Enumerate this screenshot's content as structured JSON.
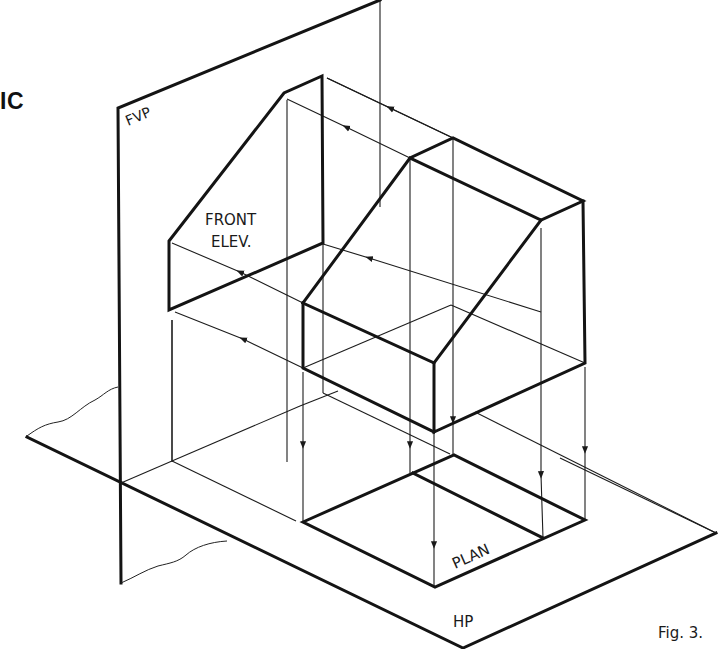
{
  "figure": {
    "title_fragment": "IC",
    "caption": "Fig. 3.",
    "labels": {
      "front_vertical_plane": "FVP",
      "horizontal_plane": "HP",
      "front_elevation_line1": "FRONT",
      "front_elevation_line2": "ELEV.",
      "plan": "PLAN"
    },
    "colors": {
      "ink": "#141414",
      "background": "#ffffff"
    }
  }
}
